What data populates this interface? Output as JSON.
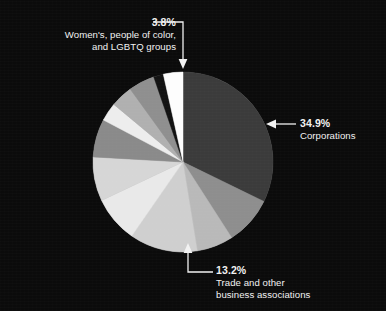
{
  "background_color": "#0b0b0b",
  "text_color": "#f2f2f2",
  "chart_data": {
    "type": "pie",
    "title": "",
    "subtitle": "",
    "xlabel": "",
    "ylabel": "",
    "grid": false,
    "legend_position": "none",
    "center": {
      "x": 183,
      "y": 162
    },
    "radius": 90,
    "start_angle_deg": 0,
    "direction": "clockwise",
    "labels": [
      "Corporations",
      "Trade and other business associations",
      "Women's, people of color, and LGBTQ groups"
    ],
    "values": [
      34.9,
      13.2,
      3.8
    ],
    "slices": [
      {
        "name": "corporations",
        "label": "Corporations",
        "value": 34.9,
        "color": "#3b3b3b",
        "labeled": true
      },
      {
        "name": "slice-2",
        "label": "",
        "value": 9.4,
        "color": "#8e8e8e",
        "labeled": false
      },
      {
        "name": "slice-3",
        "label": "",
        "value": 7.1,
        "color": "#b9b9b9",
        "labeled": false
      },
      {
        "name": "trade-associations",
        "label": "Trade and other business associations",
        "value": 13.2,
        "color": "#cfcfcf",
        "labeled": true
      },
      {
        "name": "slice-5",
        "label": "",
        "value": 9.0,
        "color": "#e9e9e9",
        "labeled": false
      },
      {
        "name": "slice-6",
        "label": "",
        "value": 8.6,
        "color": "#d6d6d6",
        "labeled": false
      },
      {
        "name": "slice-7",
        "label": "",
        "value": 7.4,
        "color": "#8a8a8a",
        "labeled": false
      },
      {
        "name": "slice-8",
        "label": "",
        "value": 3.6,
        "color": "#ededed",
        "labeled": false
      },
      {
        "name": "slice-9",
        "label": "",
        "value": 4.3,
        "color": "#b0b0b0",
        "labeled": false
      },
      {
        "name": "slice-10",
        "label": "",
        "value": 5.1,
        "color": "#8f8f8f",
        "labeled": false
      },
      {
        "name": "slice-11",
        "label": "",
        "value": 1.9,
        "color": "#121212",
        "labeled": false
      },
      {
        "name": "women-poc-lgbtq",
        "label": "Women's, people of color, and LGBTQ groups",
        "value": 3.8,
        "color": "#fdfdfd",
        "labeled": true
      }
    ]
  },
  "callouts": {
    "women": {
      "percent": "3.8%",
      "line1": "Women's, people of color,",
      "line2": "and LGBTQ groups"
    },
    "corporations": {
      "percent": "34.9%",
      "line1": "Corporations"
    },
    "trade": {
      "percent": "13.2%",
      "line1": "Trade and other",
      "line2": "business associations"
    }
  }
}
